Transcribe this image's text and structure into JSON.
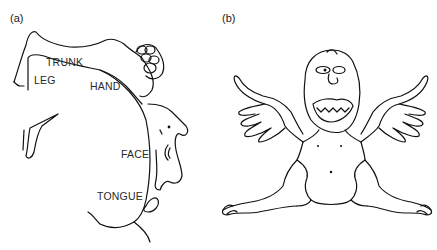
{
  "figure": {
    "panels": [
      {
        "id": "a",
        "label": "(a)",
        "description": "cortical homunculus outline over cortex",
        "regions": [
          "LEG",
          "TRUNK",
          "HAND",
          "FACE",
          "TONGUE"
        ]
      },
      {
        "id": "b",
        "label": "(b)",
        "description": "sensory homunculus figure"
      }
    ]
  }
}
